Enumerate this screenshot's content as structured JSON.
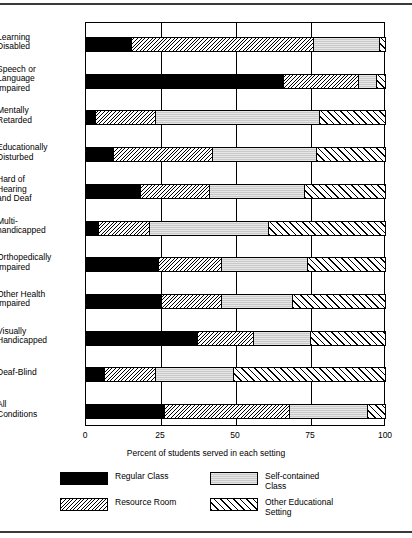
{
  "chart_data": {
    "type": "bar",
    "orientation": "horizontal",
    "stacked": true,
    "title": "",
    "xlabel": "Percent of students served in each setting",
    "ylabel": "",
    "xlim": [
      0,
      100
    ],
    "xticks": [
      "0",
      "25",
      "50",
      "75",
      "100"
    ],
    "xtick_values": [
      0,
      25,
      50,
      75,
      100
    ],
    "grid": true,
    "legend_position": "bottom",
    "categories": [
      "Learning Disabled",
      "Speech or Language Impaired",
      "Mentally Retarded",
      "Educationally Disturbed",
      "Hard of Hearing and Deaf",
      "Multi-handicapped",
      "Orthopedically Impaired",
      "Other Health Impaired",
      "Visually Handicapped",
      "Deaf-Blind",
      "All Conditions"
    ],
    "category_lines": [
      [
        "Learning",
        "Disabled"
      ],
      [
        "Speech or",
        "Language",
        "Impaired"
      ],
      [
        "Mentally",
        "Retarded"
      ],
      [
        "Educationally",
        "Disturbed"
      ],
      [
        "Hard of",
        "Hearing",
        "and Deaf"
      ],
      [
        "Multi-",
        "handicapped"
      ],
      [
        "Orthopedically",
        "Impaired"
      ],
      [
        "Other Health",
        "Impaired"
      ],
      [
        "Visually",
        "Handicapped"
      ],
      [
        "Deaf-Blind"
      ],
      [
        "All",
        "Conditions"
      ]
    ],
    "series": [
      {
        "name": "Regular Class",
        "key": "regular",
        "values": [
          15,
          66,
          3,
          9,
          18,
          4,
          24,
          25,
          37,
          6,
          26
        ]
      },
      {
        "name": "Resource Room",
        "key": "resource",
        "values": [
          61,
          25,
          20,
          33,
          23,
          17,
          21,
          20,
          19,
          17,
          42
        ]
      },
      {
        "name": "Self-contained Class",
        "key": "selfcontained",
        "values": [
          22,
          6,
          55,
          35,
          32,
          40,
          29,
          24,
          19,
          26,
          26
        ]
      },
      {
        "name": "Other Educational Setting",
        "key": "other",
        "values": [
          2,
          3,
          22,
          23,
          27,
          39,
          26,
          31,
          25,
          51,
          6
        ]
      }
    ]
  },
  "legend": {
    "items": [
      {
        "label_lines": [
          "Regular Class"
        ],
        "key": "regular"
      },
      {
        "label_lines": [
          "Self-contained",
          "Class"
        ],
        "key": "selfcontained"
      },
      {
        "label_lines": [
          "Resource Room"
        ],
        "key": "resource"
      },
      {
        "label_lines": [
          "Other Educational",
          "Setting"
        ],
        "key": "other"
      }
    ]
  },
  "colors": {
    "regular": "#000000",
    "selfcontained": "#c9c9c9",
    "background": "#ffffff",
    "axis": "#000000"
  }
}
